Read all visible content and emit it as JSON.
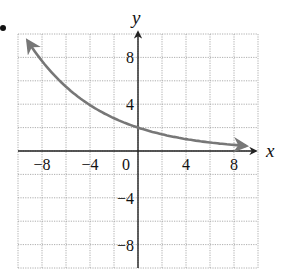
{
  "chart_data": {
    "type": "line",
    "title": "",
    "xlabel": "x",
    "ylabel": "y",
    "xlim": [
      -10,
      10
    ],
    "ylim": [
      -10,
      10
    ],
    "grid": true,
    "grid_step": 2,
    "x_ticks": [
      -8,
      -4,
      0,
      4,
      8
    ],
    "x_tick_labels": [
      "−8",
      "−4",
      "0",
      "4",
      "8"
    ],
    "y_ticks": [
      8,
      4,
      -4,
      -8
    ],
    "y_tick_labels": [
      "8",
      "4",
      "−4",
      "−8"
    ],
    "series": [
      {
        "name": "exponential decay curve",
        "equation_approx": "y = 2(0.845)^x",
        "x": [
          -9,
          -8,
          -6,
          -4,
          -2,
          0,
          2,
          4,
          6,
          8,
          9
        ],
        "y": [
          9.1,
          7.7,
          5.5,
          3.9,
          2.8,
          2.0,
          1.4,
          1.0,
          0.73,
          0.52,
          0.44
        ],
        "arrows_both_ends": true,
        "color": "#777777"
      }
    ]
  },
  "labels": {
    "x_axis": "x",
    "y_axis": "y",
    "origin": "0"
  }
}
